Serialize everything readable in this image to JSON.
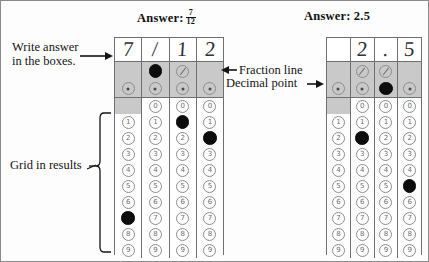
{
  "figure": {
    "caption_left": "Answer:",
    "caption_right": "Answer:",
    "answer_left_numerator": "7",
    "answer_left_denominator": "12",
    "answer_right": "2.5"
  },
  "annotations": {
    "write_answer": "Write answer\nin the boxes.",
    "write_answer_line1": "Write answer",
    "write_answer_line2": "in the boxes.",
    "fraction_line": "Fraction line",
    "decimal_point": "Decimal point",
    "grid_in_results": "Grid in results"
  },
  "grids": [
    {
      "name": "fraction-grid",
      "answer_written": [
        "7",
        "/",
        "1",
        "2"
      ],
      "columns": [
        {
          "written": "7",
          "fraction_bubble": "none",
          "decimal_bubble": "dot",
          "zero_bubble": "none",
          "digits": [
            "0",
            "1",
            "2",
            "3",
            "4",
            "5",
            "6",
            "7",
            "8",
            "9"
          ],
          "filled_digit": "7",
          "fraction_filled": false,
          "decimal_filled": false
        },
        {
          "written": "/",
          "fraction_bubble": "slash",
          "decimal_bubble": "dot",
          "zero_bubble": "digit",
          "digits": [
            "0",
            "1",
            "2",
            "3",
            "4",
            "5",
            "6",
            "7",
            "8",
            "9"
          ],
          "filled_digit": null,
          "fraction_filled": true,
          "decimal_filled": false
        },
        {
          "written": "1",
          "fraction_bubble": "slash",
          "decimal_bubble": "dot",
          "zero_bubble": "digit",
          "digits": [
            "0",
            "1",
            "2",
            "3",
            "4",
            "5",
            "6",
            "7",
            "8",
            "9"
          ],
          "filled_digit": "1",
          "fraction_filled": false,
          "decimal_filled": false
        },
        {
          "written": "2",
          "fraction_bubble": "none",
          "decimal_bubble": "dot",
          "zero_bubble": "digit",
          "digits": [
            "0",
            "1",
            "2",
            "3",
            "4",
            "5",
            "6",
            "7",
            "8",
            "9"
          ],
          "filled_digit": "2",
          "fraction_filled": false,
          "decimal_filled": false
        }
      ]
    },
    {
      "name": "decimal-grid",
      "answer_written": [
        "",
        "2",
        ".",
        "5"
      ],
      "columns": [
        {
          "written": "",
          "fraction_bubble": "none",
          "decimal_bubble": "dot",
          "zero_bubble": "none",
          "digits": [
            "0",
            "1",
            "2",
            "3",
            "4",
            "5",
            "6",
            "7",
            "8",
            "9"
          ],
          "filled_digit": null,
          "fraction_filled": false,
          "decimal_filled": false
        },
        {
          "written": "2",
          "fraction_bubble": "slash",
          "decimal_bubble": "dot",
          "zero_bubble": "digit",
          "digits": [
            "0",
            "1",
            "2",
            "3",
            "4",
            "5",
            "6",
            "7",
            "8",
            "9"
          ],
          "filled_digit": "2",
          "fraction_filled": false,
          "decimal_filled": false
        },
        {
          "written": ".",
          "fraction_bubble": "slash",
          "decimal_bubble": "dot",
          "zero_bubble": "digit",
          "digits": [
            "0",
            "1",
            "2",
            "3",
            "4",
            "5",
            "6",
            "7",
            "8",
            "9"
          ],
          "filled_digit": null,
          "fraction_filled": false,
          "decimal_filled": true
        },
        {
          "written": "5",
          "fraction_bubble": "none",
          "decimal_bubble": "dot",
          "zero_bubble": "digit",
          "digits": [
            "0",
            "1",
            "2",
            "3",
            "4",
            "5",
            "6",
            "7",
            "8",
            "9"
          ],
          "filled_digit": "5",
          "fraction_filled": false,
          "decimal_filled": false
        }
      ]
    }
  ],
  "colors": {
    "band_gray": "#c9c9c9",
    "border_gray": "#6f6f6f",
    "bubble_gray": "#8c8c8c",
    "filled_black": "#0d0d0d"
  }
}
